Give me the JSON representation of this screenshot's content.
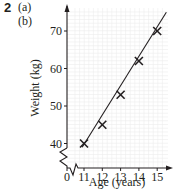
{
  "question": {
    "number": "2",
    "parts": [
      "(a)",
      "(b)"
    ]
  },
  "chart_data": {
    "type": "scatter",
    "title": "",
    "xlabel": "Age (years)",
    "ylabel": "Weight (kg)",
    "x_ticks": [
      "0",
      "11",
      "12",
      "13",
      "14",
      "15"
    ],
    "y_ticks": [
      "40",
      "50",
      "60",
      "70"
    ],
    "xlim": [
      10.5,
      15.6
    ],
    "ylim": [
      38,
      76
    ],
    "axis_break_x": true,
    "axis_break_y": true,
    "grid": true,
    "markers": "x",
    "points": [
      {
        "x": 11,
        "y": 40
      },
      {
        "x": 12,
        "y": 45
      },
      {
        "x": 13,
        "y": 53
      },
      {
        "x": 14,
        "y": 62
      },
      {
        "x": 15,
        "y": 70
      }
    ],
    "line_of_best_fit": {
      "from": {
        "x": 10.9,
        "y": 39
      },
      "to": {
        "x": 15.5,
        "y": 75
      }
    },
    "colors": {
      "ink": "#231f20",
      "grid": "#e6e6e6"
    }
  }
}
